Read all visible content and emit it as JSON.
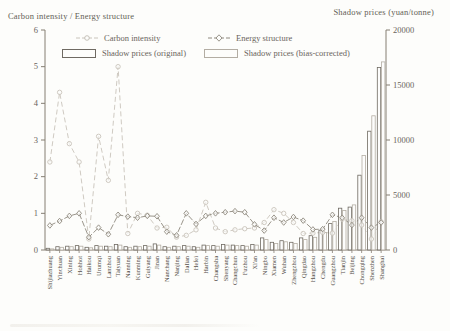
{
  "figure": {
    "left_axis_title": "Carbon intensity / Energy structure",
    "right_axis_title": "Shadow prices (yuan/tonne)"
  },
  "colors": {
    "background": "#fdfdfb",
    "axis": "#857e73",
    "tick_text": "#6a645b",
    "category_text": "#55504a",
    "carbon_line": "#c9c4bb",
    "energy_line": "#8f897e",
    "bar_original": "#6f6a62",
    "bar_corrected": "#b3ada3",
    "bar_fill": "#fdfdfb"
  },
  "chart_data": {
    "type": "combo-bar-line",
    "title": "",
    "legend_position": "top",
    "grid": false,
    "categories": [
      "Shijiazhuang",
      "Yinchuan",
      "Xining",
      "Hohhot",
      "Haikou",
      "Urumqi",
      "Lanzhou",
      "Taiyuan",
      "Nanning",
      "Kunming",
      "Guiyang",
      "Jinan",
      "Nanchang",
      "Nanjing",
      "Dalian",
      "Hefei",
      "Harbin",
      "Changsha",
      "Shenyang",
      "Changchun",
      "Fuzhou",
      "Xi'an",
      "Ningbo",
      "Xiamen",
      "Wuhan",
      "Zhengzhou",
      "Qingdao",
      "Hangzhou",
      "Chengdu",
      "Guangzhou",
      "Tianjin",
      "Beijing",
      "Chongqing",
      "Shenzhen",
      "Shanghai"
    ],
    "left_axis": {
      "label": "Carbon intensity / Energy structure",
      "min": 0,
      "max": 6,
      "ticks": [
        0,
        1,
        2,
        3,
        4,
        5,
        6
      ]
    },
    "right_axis": {
      "label": "Shadow prices (yuan/tonne)",
      "min": 0,
      "max": 20000,
      "ticks": [
        0,
        5000,
        10000,
        15000,
        20000
      ]
    },
    "series": [
      {
        "name": "Carbon intensity",
        "type": "line",
        "axis": "left",
        "marker": "circle",
        "values": [
          2.4,
          4.3,
          2.9,
          2.4,
          0.3,
          3.1,
          1.9,
          5.0,
          0.45,
          1.0,
          0.95,
          0.6,
          0.62,
          0.35,
          0.4,
          0.55,
          1.3,
          0.6,
          0.5,
          0.55,
          0.58,
          0.6,
          0.75,
          1.1,
          1.0,
          0.75,
          0.45,
          0.46,
          0.48,
          0.46,
          0.84,
          0.8,
          0.68,
          0.3,
          0.77
        ]
      },
      {
        "name": "Energy structure",
        "type": "line",
        "axis": "left",
        "marker": "diamond",
        "values": [
          0.67,
          0.79,
          0.93,
          1.0,
          0.35,
          0.61,
          0.43,
          0.96,
          0.91,
          0.88,
          0.93,
          0.92,
          0.5,
          0.4,
          1.0,
          0.71,
          0.93,
          1.0,
          1.03,
          1.06,
          1.03,
          0.7,
          0.53,
          0.88,
          0.75,
          0.9,
          0.8,
          0.56,
          0.57,
          0.96,
          0.88,
          0.68,
          0.88,
          0.61,
          0.75
        ]
      },
      {
        "name": "Shadow prices (original)",
        "type": "bar",
        "axis": "right",
        "values": [
          150,
          300,
          350,
          400,
          250,
          400,
          350,
          500,
          300,
          350,
          400,
          550,
          300,
          350,
          400,
          300,
          450,
          400,
          500,
          450,
          400,
          500,
          1100,
          700,
          850,
          700,
          1100,
          1300,
          1800,
          2400,
          3800,
          3900,
          6800,
          10800,
          16600
        ]
      },
      {
        "name": "Shadow prices (bias-corrected)",
        "type": "bar",
        "axis": "right",
        "values": [
          100,
          250,
          300,
          350,
          200,
          350,
          300,
          450,
          250,
          300,
          350,
          450,
          250,
          300,
          350,
          250,
          400,
          350,
          450,
          400,
          350,
          450,
          950,
          600,
          750,
          600,
          950,
          1150,
          1600,
          2600,
          3600,
          4100,
          8600,
          12200,
          17100
        ]
      }
    ]
  }
}
